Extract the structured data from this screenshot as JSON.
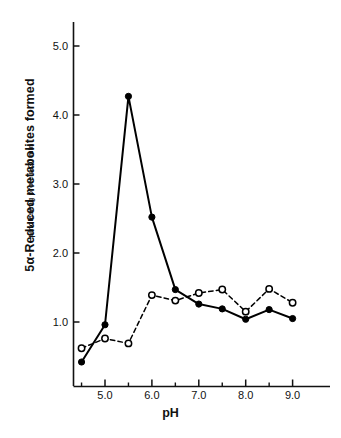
{
  "chart_data": {
    "type": "line",
    "title": "",
    "xlabel": "pH",
    "ylabel": "5α-Reduced metabolites formed",
    "ylabel_units": "pmoles/mg protein/30 min",
    "xlim": [
      4.3,
      9.3
    ],
    "ylim": [
      0.0,
      5.45
    ],
    "grid": false,
    "legend": "none",
    "x_ticks_major": [
      "5.0",
      "6.0",
      "7.0",
      "8.0",
      "9.0"
    ],
    "x_ticks_major_values": [
      5.0,
      6.0,
      7.0,
      8.0,
      9.0
    ],
    "x_ticks_minor_values": [
      4.5,
      5.5,
      6.5,
      7.5,
      8.5
    ],
    "y_ticks_major": [
      "1.0",
      "2.0",
      "3.0",
      "4.0",
      "5.0"
    ],
    "y_ticks_major_values": [
      1.0,
      2.0,
      3.0,
      4.0,
      5.0
    ],
    "x": [
      4.5,
      5.0,
      5.5,
      6.0,
      6.5,
      7.0,
      7.5,
      8.0,
      8.5,
      9.0
    ],
    "series": [
      {
        "name": "solid-filled-circles",
        "marker": "filled-circle",
        "linestyle": "solid",
        "color": "#000000",
        "values": [
          0.42,
          0.96,
          4.27,
          2.52,
          1.47,
          1.26,
          1.19,
          1.04,
          1.18,
          1.05
        ]
      },
      {
        "name": "dashed-open-circles",
        "marker": "open-circle",
        "linestyle": "dashed",
        "color": "#000000",
        "values": [
          0.62,
          0.76,
          0.69,
          1.39,
          1.31,
          1.42,
          1.47,
          1.15,
          1.48,
          1.28
        ]
      }
    ]
  },
  "axes": {
    "x_axis_name": "pH axis",
    "y_axis_name": "metabolites axis"
  }
}
